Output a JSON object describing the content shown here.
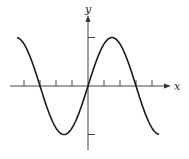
{
  "chart_data": {
    "type": "line",
    "title": "",
    "xlabel": "x",
    "ylabel": "y",
    "function": "y = sin(x)",
    "x_tick_spacing": "pi/3",
    "x_ticks": [
      -4,
      -3,
      -2,
      -1,
      1,
      2,
      3,
      4
    ],
    "x_ticks_unit": "pi/3",
    "y_ticks": [
      -1,
      1
    ],
    "xlim_units_of_tick": [
      -4.9,
      5.1
    ],
    "ylim": [
      -1.35,
      1.45
    ],
    "grid": false,
    "legend": null,
    "series": [
      {
        "name": "sin(x)",
        "x": [
          -4.6,
          -4.5,
          -3,
          -1.5,
          0,
          1.5,
          3,
          4.5
        ],
        "x_unit": "pi/3 ticks",
        "values": [
          0.97,
          1.0,
          0.0,
          -1.0,
          0.0,
          1.0,
          0.0,
          -1.0
        ],
        "color": "#1a1a1a"
      }
    ]
  },
  "axes": {
    "x_label": "x",
    "y_label": "y",
    "color": "#333333"
  }
}
